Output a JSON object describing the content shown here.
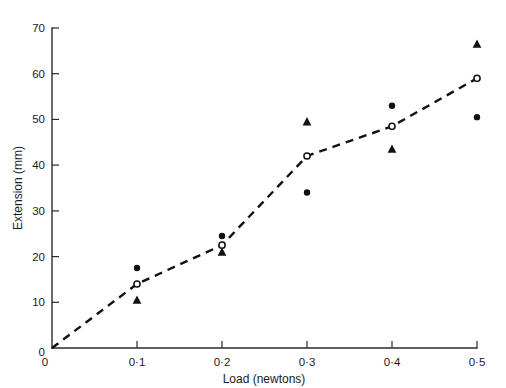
{
  "chart_data": {
    "type": "scatter",
    "title": "",
    "xlabel": "Load (newtons)",
    "ylabel": "Extension (mm)",
    "xlim": [
      0,
      0.5
    ],
    "ylim": [
      0,
      70
    ],
    "grid": false,
    "legend_position": "none",
    "x_tick_labels": [
      "0",
      "0·1",
      "0·2",
      "0·3",
      "0·4",
      "0·5"
    ],
    "x_tick_values": [
      0,
      0.1,
      0.2,
      0.3,
      0.4,
      0.5
    ],
    "y_tick_labels": [
      "0",
      "10",
      "20",
      "30",
      "40",
      "50",
      "60",
      "70"
    ],
    "y_tick_values": [
      0,
      10,
      20,
      30,
      40,
      50,
      60,
      70
    ],
    "x": [
      0.1,
      0.2,
      0.3,
      0.4,
      0.5
    ],
    "series": [
      {
        "name": "filled-circle",
        "marker": "filled circle",
        "connected": false,
        "x": [
          0.1,
          0.2,
          0.3,
          0.4,
          0.5
        ],
        "values": [
          17.5,
          24.5,
          34,
          53,
          50.5
        ]
      },
      {
        "name": "open-circle",
        "marker": "open circle",
        "connected": true,
        "line_style": "dashed",
        "x": [
          0,
          0.1,
          0.2,
          0.3,
          0.4,
          0.5
        ],
        "values": [
          0,
          14,
          22.5,
          42,
          48.5,
          59
        ]
      },
      {
        "name": "filled-triangle",
        "marker": "filled triangle",
        "connected": false,
        "x": [
          0.1,
          0.2,
          0.3,
          0.4,
          0.5
        ],
        "values": [
          10.5,
          21,
          49.5,
          43.5,
          66.5
        ]
      }
    ],
    "colors": {
      "ink": "#111111",
      "axis": "#2b2b2b",
      "background": "#ffffff"
    }
  }
}
